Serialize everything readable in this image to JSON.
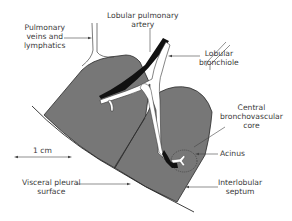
{
  "figure": {
    "type": "anatomical-diagram"
  },
  "labels": {
    "pulmonary_veins": [
      "Pulmonary",
      "veins and",
      "lymphatics"
    ],
    "lobular_artery": [
      "Lobular pulmonary",
      "artery"
    ],
    "lobular_bronchiole": [
      "Lobular",
      "bronchiole"
    ],
    "central_core": [
      "Central",
      "bronchovascular",
      "core"
    ],
    "acinus": [
      "Acinus"
    ],
    "scale": [
      "1 cm"
    ],
    "visceral_pleura": [
      "Visceral pleural",
      "surface"
    ],
    "interlobular_septum": [
      "Interlobular",
      "septum"
    ]
  },
  "colors": {
    "lobule_fill": "#777777",
    "outline": "#2a2a2a",
    "artery": "#111111",
    "airway_fill": "#ffffff",
    "label_text": "#3a3a3a",
    "leader_line": "#444444"
  }
}
